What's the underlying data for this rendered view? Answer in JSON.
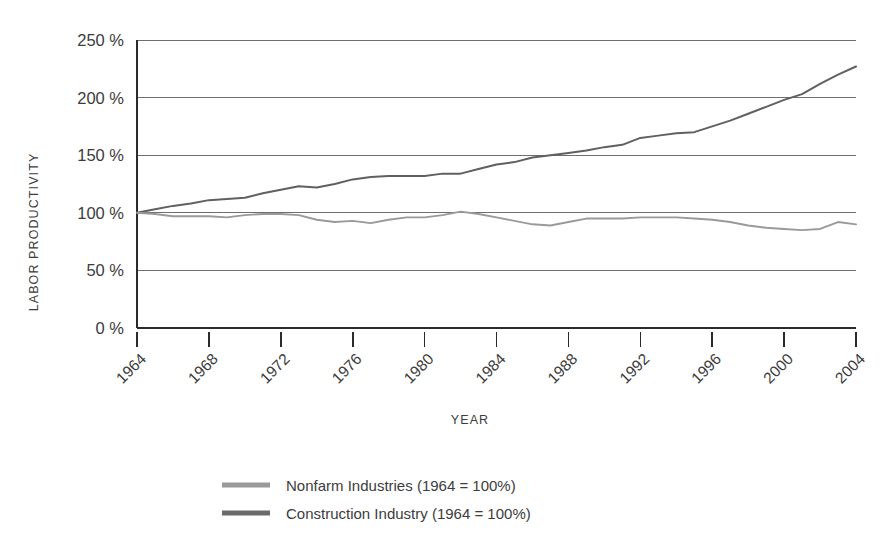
{
  "chart_data": {
    "type": "line",
    "title": "",
    "xlabel": "YEAR",
    "ylabel": "LABOR PRODUCTIVITY",
    "xlim": [
      1964,
      2004
    ],
    "ylim": [
      0,
      250
    ],
    "yticks": [
      0,
      50,
      100,
      150,
      200,
      250
    ],
    "ytick_labels": [
      "0 %",
      "50 %",
      "100 %",
      "150 %",
      "200 %",
      "250 %"
    ],
    "xticks": [
      1964,
      1968,
      1972,
      1976,
      1980,
      1984,
      1988,
      1992,
      1996,
      2000,
      2004
    ],
    "xtick_labels": [
      "1964",
      "1968",
      "1972",
      "1976",
      "1980",
      "1984",
      "1988",
      "1992",
      "1996",
      "2000",
      "2004"
    ],
    "grid": "horizontal",
    "legend_position": "bottom-center",
    "x": [
      1964,
      1965,
      1966,
      1967,
      1968,
      1969,
      1970,
      1971,
      1972,
      1973,
      1974,
      1975,
      1976,
      1977,
      1978,
      1979,
      1980,
      1981,
      1982,
      1983,
      1984,
      1985,
      1986,
      1987,
      1988,
      1989,
      1990,
      1991,
      1992,
      1993,
      1994,
      1995,
      1996,
      1997,
      1998,
      1999,
      2000,
      2001,
      2002,
      2003,
      2004
    ],
    "series": [
      {
        "name": "Nonfarm Industries (1964 = 100%)",
        "color": "#606060",
        "values": [
          100,
          103,
          106,
          108,
          111,
          112,
          113,
          117,
          120,
          123,
          122,
          125,
          129,
          131,
          132,
          132,
          132,
          134,
          134,
          138,
          142,
          144,
          148,
          150,
          152,
          154,
          157,
          159,
          165,
          167,
          169,
          170,
          175,
          180,
          186,
          192,
          198,
          203,
          212,
          220,
          227
        ]
      },
      {
        "name": "Construction Industry (1964 = 100%)",
        "color": "#9a9a9a",
        "values": [
          100,
          99,
          97,
          97,
          97,
          96,
          98,
          99,
          99,
          98,
          94,
          92,
          93,
          91,
          94,
          96,
          96,
          98,
          101,
          99,
          96,
          93,
          90,
          89,
          92,
          95,
          95,
          95,
          96,
          96,
          96,
          95,
          94,
          92,
          89,
          87,
          86,
          85,
          86,
          92,
          90
        ]
      }
    ]
  },
  "legend": {
    "items": [
      {
        "label": "Nonfarm Industries (1964 = 100%)",
        "color": "#9a9a9a"
      },
      {
        "label": "Construction Industry (1964 = 100%)",
        "color": "#6a6a6a"
      }
    ]
  },
  "colors": {
    "background": "#ffffff",
    "axis": "#2b2b2b",
    "gridline": "#6e6e6e",
    "text": "#3c3c3c"
  }
}
